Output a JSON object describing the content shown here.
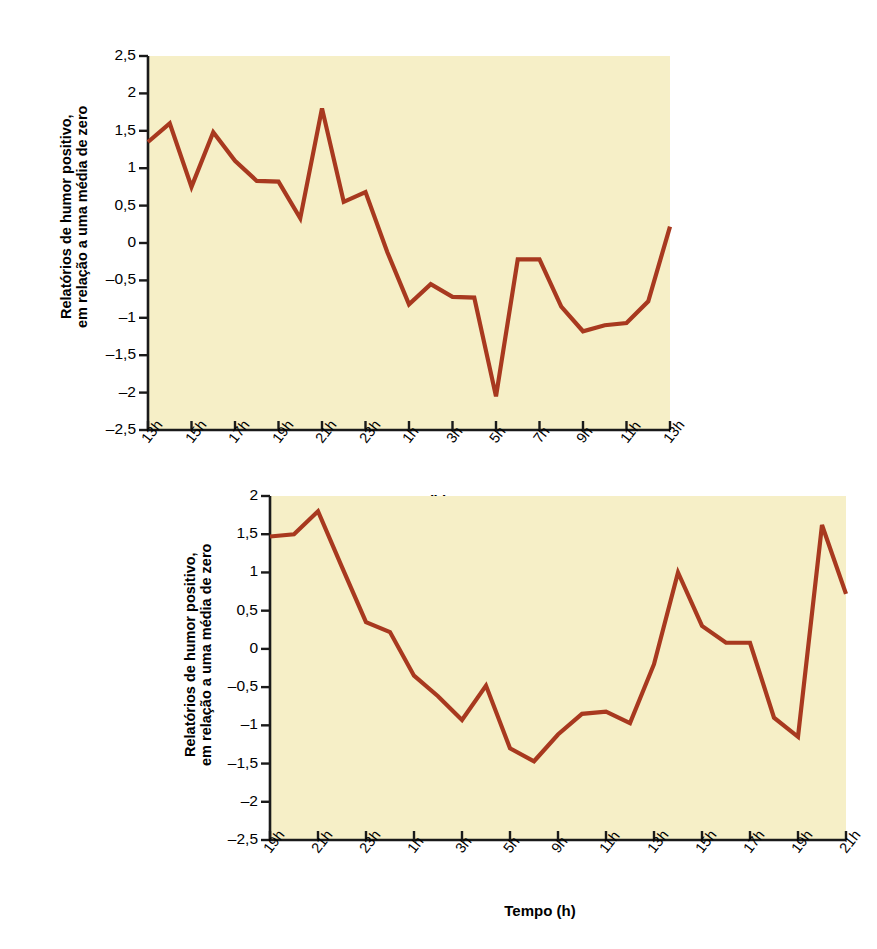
{
  "figure": {
    "background_color": "#ffffff",
    "plot_background_color": "#F6EFC7",
    "line_color": "#A8391F",
    "axis_color": "#1a1a1a"
  },
  "chart_data": [
    {
      "id": "chart-top",
      "type": "line",
      "title": "",
      "xlabel": "Tempo (h)",
      "ylabel": "Relatórios de humor positivo,\nem relação a uma média de zero",
      "ylim": [
        -2.5,
        2.5
      ],
      "yticks": [
        "2,5",
        "2",
        "1,5",
        "1",
        "0,5",
        "0",
        "–0,5",
        "–1",
        "–1,5",
        "–2",
        "–2,5"
      ],
      "ytick_values": [
        2.5,
        2,
        1.5,
        1,
        0.5,
        0,
        -0.5,
        -1,
        -1.5,
        -2,
        -2.5
      ],
      "xticks": [
        "13h",
        "15h",
        "17h",
        "19h",
        "21h",
        "23h",
        "1h",
        "3h",
        "5h",
        "7h",
        "9h",
        "11h",
        "13h"
      ],
      "grid": false,
      "legend": "none",
      "x": [
        0,
        1,
        2,
        3,
        4,
        5,
        6,
        7,
        8,
        9,
        10,
        11,
        12,
        13,
        14,
        15,
        16,
        17,
        18,
        19,
        20,
        21,
        22,
        23,
        24
      ],
      "values": [
        1.35,
        1.6,
        0.75,
        1.48,
        1.1,
        0.83,
        0.82,
        0.33,
        1.8,
        0.55,
        0.68,
        -0.12,
        -0.82,
        -0.55,
        -0.72,
        -0.73,
        -2.05,
        -0.22,
        -0.22,
        -0.85,
        -1.18,
        -1.1,
        -1.07,
        -0.78,
        0.22
      ]
    },
    {
      "id": "chart-bottom",
      "type": "line",
      "title": "",
      "xlabel": "Tempo (h)",
      "ylabel": "Relatórios de humor positivo,\nem relação a uma média de zero",
      "ylim": [
        -2.5,
        2.0
      ],
      "yticks": [
        "2",
        "1,5",
        "1",
        "0,5",
        "0",
        "–0,5",
        "–1",
        "–1,5",
        "–2",
        "–2,5"
      ],
      "ytick_values": [
        2,
        1.5,
        1,
        0.5,
        0,
        -0.5,
        -1,
        -1.5,
        -2,
        -2.5
      ],
      "xticks": [
        "19h",
        "21h",
        "23h",
        "1h",
        "3h",
        "5h",
        "9h",
        "11h",
        "13h",
        "15h",
        "17h",
        "19h",
        "21h"
      ],
      "grid": false,
      "legend": "none",
      "x": [
        0,
        1,
        2,
        3,
        4,
        5,
        6,
        7,
        8,
        9,
        10,
        11,
        12,
        13,
        14,
        15,
        16,
        17,
        18,
        19,
        20,
        21,
        22,
        23,
        24
      ],
      "values": [
        1.47,
        1.5,
        1.8,
        1.07,
        0.35,
        0.22,
        -0.35,
        -0.62,
        -0.93,
        -0.48,
        -1.3,
        -1.47,
        -1.12,
        -0.85,
        -0.82,
        -0.97,
        -0.2,
        1.0,
        0.3,
        0.08,
        0.08,
        -0.9,
        -1.15,
        1.62,
        0.72
      ]
    }
  ]
}
